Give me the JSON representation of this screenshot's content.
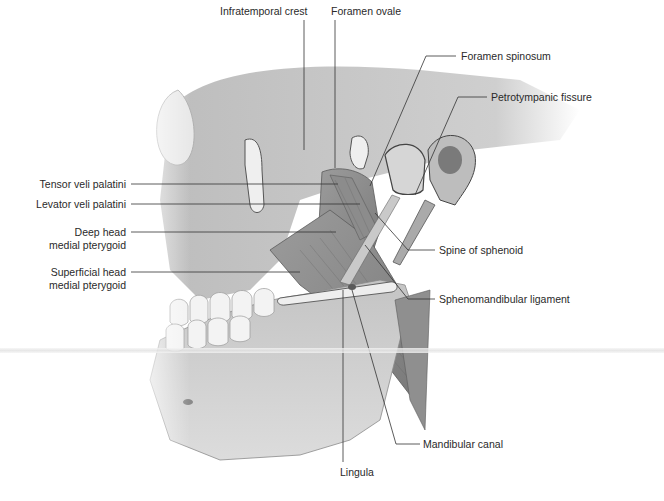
{
  "figure": {
    "palette": {
      "bone": "#d9d9d9",
      "bone_shadow": "#9a9a9a",
      "muscle": "#8a8a8a",
      "muscle_dark": "#6e6e6e",
      "line": "#333333",
      "text": "#2a2a2a"
    },
    "labels": [
      {
        "id": "infratemporal-crest",
        "text": "Infratemporal crest"
      },
      {
        "id": "foramen-ovale",
        "text": "Foramen ovale"
      },
      {
        "id": "foramen-spinosum",
        "text": "Foramen spinosum"
      },
      {
        "id": "petrotympanic-fissure",
        "text": "Petrotympanic fissure"
      },
      {
        "id": "tensor-veli-palatini",
        "text": "Tensor veli palatini"
      },
      {
        "id": "levator-veli-palatini",
        "text": "Levator veli palatini"
      },
      {
        "id": "deep-head-medial-pterygoid",
        "line1": "Deep head",
        "line2": "medial pterygoid"
      },
      {
        "id": "superficial-head-medial-pterygoid",
        "line1": "Superficial head",
        "line2": "medial pterygoid"
      },
      {
        "id": "spine-of-sphenoid",
        "text": "Spine of sphenoid"
      },
      {
        "id": "sphenomandibular-ligament",
        "text": "Sphenomandibular ligament"
      },
      {
        "id": "mandibular-canal",
        "text": "Mandibular canal"
      },
      {
        "id": "lingula",
        "text": "Lingula"
      }
    ]
  }
}
